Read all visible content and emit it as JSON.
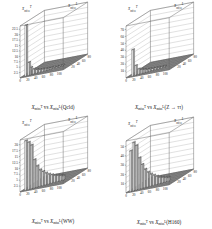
{
  "figure": {
    "type": "multi-panel-3d-lego",
    "panels": 4,
    "layout": "2x2"
  },
  "chart_data": [
    {
      "type": "bar",
      "panel": 1,
      "position": "top-left",
      "title": "",
      "caption": "Xᵀmiss vs Xᴸmiss (QCD)",
      "caption_parts": {
        "var_y": "X",
        "sub_y": "miss",
        "sup_y": "T",
        "vs": "vs",
        "var_x": "X",
        "sub_x": "miss",
        "sup_x": "L",
        "sample": "(Qcld)"
      },
      "sample_label": "QCD",
      "xlabel": "Xᴸmiss",
      "ylabel": "Xᵀmiss",
      "zlabel": "",
      "xticks": [
        0,
        20,
        40,
        60,
        80,
        100
      ],
      "yticks": [
        20,
        40,
        60,
        80
      ],
      "zticks": [
        2.5,
        5,
        7.5,
        10,
        12.5,
        15,
        17.5,
        20,
        22.5
      ],
      "zlim": [
        0,
        24
      ],
      "xlim": [
        0,
        110
      ],
      "ylim": [
        0,
        90
      ],
      "grid": true,
      "legend": "none",
      "peak_value": 23.5,
      "peak_x": 8,
      "peak_y": 6,
      "bars": [
        {
          "x": 8,
          "y": 6,
          "z": 23.5
        },
        {
          "x": 14,
          "y": 8,
          "z": 6.0
        },
        {
          "x": 18,
          "y": 10,
          "z": 3.4
        },
        {
          "x": 24,
          "y": 12,
          "z": 2.3
        },
        {
          "x": 30,
          "y": 14,
          "z": 1.7
        },
        {
          "x": 36,
          "y": 16,
          "z": 1.3
        },
        {
          "x": 42,
          "y": 18,
          "z": 1.1
        },
        {
          "x": 48,
          "y": 20,
          "z": 0.9
        },
        {
          "x": 54,
          "y": 22,
          "z": 0.8
        },
        {
          "x": 60,
          "y": 24,
          "z": 0.7
        },
        {
          "x": 66,
          "y": 26,
          "z": 0.6
        },
        {
          "x": 72,
          "y": 28,
          "z": 0.5
        },
        {
          "x": 78,
          "y": 30,
          "z": 0.45
        },
        {
          "x": 84,
          "y": 32,
          "z": 0.4
        }
      ]
    },
    {
      "type": "bar",
      "panel": 2,
      "position": "top-right",
      "title": "",
      "caption": "Xᵀmiss vs Xᴸmiss (Z → ττ)",
      "caption_parts": {
        "var_y": "X",
        "sub_y": "miss",
        "sup_y": "T",
        "vs": "vs",
        "var_x": "X",
        "sub_x": "miss",
        "sup_x": "L",
        "sample": "(Z → ττ)"
      },
      "sample_label": "Z → ττ",
      "xlabel": "Xᴸmiss",
      "ylabel": "Xᵀmiss",
      "zlabel": "",
      "xticks": [
        0,
        20,
        40,
        60,
        80,
        100
      ],
      "yticks": [
        20,
        40,
        60,
        80
      ],
      "zticks": [
        10,
        20,
        30,
        40,
        50,
        60,
        70
      ],
      "zlim": [
        0,
        75
      ],
      "xlim": [
        0,
        110
      ],
      "ylim": [
        0,
        90
      ],
      "grid": true,
      "legend": "none",
      "peak_value": 38,
      "peak_x": 10,
      "peak_y": 6,
      "bars": [
        {
          "x": 10,
          "y": 6,
          "z": 38.0
        },
        {
          "x": 16,
          "y": 8,
          "z": 14.0
        },
        {
          "x": 22,
          "y": 10,
          "z": 8.0
        },
        {
          "x": 28,
          "y": 12,
          "z": 6.0
        },
        {
          "x": 34,
          "y": 14,
          "z": 5.0
        },
        {
          "x": 40,
          "y": 16,
          "z": 4.0
        },
        {
          "x": 46,
          "y": 18,
          "z": 3.4
        },
        {
          "x": 52,
          "y": 20,
          "z": 3.0
        },
        {
          "x": 58,
          "y": 22,
          "z": 2.6
        },
        {
          "x": 64,
          "y": 24,
          "z": 2.2
        },
        {
          "x": 70,
          "y": 26,
          "z": 1.9
        },
        {
          "x": 76,
          "y": 28,
          "z": 1.6
        }
      ]
    },
    {
      "type": "bar",
      "panel": 3,
      "position": "bottom-left",
      "title": "",
      "caption": "Xᵀmiss vs Xᴸmiss (WW)",
      "caption_parts": {
        "var_y": "X",
        "sub_y": "miss",
        "sup_y": "T",
        "vs": "vs",
        "var_x": "X",
        "sub_x": "miss",
        "sup_x": "L",
        "sample": "(WW)"
      },
      "sample_label": "WW",
      "xlabel": "Xᴸmiss",
      "ylabel": "Xᵀmiss",
      "zlabel": "",
      "xticks": [
        0,
        20,
        40,
        60,
        80,
        100
      ],
      "yticks": [
        20,
        40,
        60,
        80
      ],
      "zticks": [
        2.5,
        5,
        7.5,
        10,
        12.5,
        15,
        17.5,
        20
      ],
      "zlim": [
        0,
        22
      ],
      "xlim": [
        0,
        110
      ],
      "ylim": [
        0,
        90
      ],
      "grid": true,
      "legend": "none",
      "peak_value": 21,
      "peak_x": 10,
      "peak_y": 6,
      "bars": [
        {
          "x": 8,
          "y": 5,
          "z": 21.0
        },
        {
          "x": 14,
          "y": 7,
          "z": 20.0
        },
        {
          "x": 20,
          "y": 9,
          "z": 18.5
        },
        {
          "x": 26,
          "y": 11,
          "z": 12.0
        },
        {
          "x": 32,
          "y": 13,
          "z": 9.0
        },
        {
          "x": 38,
          "y": 15,
          "z": 7.0
        },
        {
          "x": 44,
          "y": 17,
          "z": 6.0
        },
        {
          "x": 50,
          "y": 19,
          "z": 5.0
        },
        {
          "x": 56,
          "y": 21,
          "z": 4.2
        },
        {
          "x": 62,
          "y": 23,
          "z": 3.6
        },
        {
          "x": 68,
          "y": 25,
          "z": 3.0
        },
        {
          "x": 74,
          "y": 27,
          "z": 2.6
        },
        {
          "x": 80,
          "y": 29,
          "z": 2.2
        },
        {
          "x": 86,
          "y": 31,
          "z": 1.8
        }
      ]
    },
    {
      "type": "bar",
      "panel": 4,
      "position": "bottom-right",
      "title": "",
      "caption": "Xᵀmiss vs Xᴸmiss (H160)",
      "caption_parts": {
        "var_y": "X",
        "sub_y": "miss",
        "sup_y": "T",
        "vs": "vs",
        "var_x": "X",
        "sub_x": "miss",
        "sup_x": "L",
        "sample": "(H160)"
      },
      "sample_label": "H160",
      "xlabel": "Xᴸmiss",
      "ylabel": "Xᵀmiss",
      "zlabel": "",
      "xticks": [
        0,
        20,
        40,
        60,
        80,
        100
      ],
      "yticks": [
        20,
        40,
        60,
        80
      ],
      "zticks": [
        10,
        20,
        30,
        40,
        50
      ],
      "zlim": [
        0,
        56
      ],
      "xlim": [
        0,
        110
      ],
      "ylim": [
        0,
        90
      ],
      "grid": true,
      "legend": "none",
      "peak_value": 52,
      "peak_x": 12,
      "peak_y": 7,
      "bars": [
        {
          "x": 6,
          "y": 4,
          "z": 44.0
        },
        {
          "x": 12,
          "y": 6,
          "z": 52.0
        },
        {
          "x": 18,
          "y": 8,
          "z": 48.0
        },
        {
          "x": 24,
          "y": 10,
          "z": 34.0
        },
        {
          "x": 30,
          "y": 12,
          "z": 26.0
        },
        {
          "x": 36,
          "y": 14,
          "z": 20.0
        },
        {
          "x": 42,
          "y": 16,
          "z": 16.0
        },
        {
          "x": 48,
          "y": 18,
          "z": 13.0
        },
        {
          "x": 54,
          "y": 20,
          "z": 11.0
        },
        {
          "x": 60,
          "y": 22,
          "z": 9.0
        },
        {
          "x": 66,
          "y": 24,
          "z": 7.0
        },
        {
          "x": 72,
          "y": 26,
          "z": 6.0
        },
        {
          "x": 78,
          "y": 28,
          "z": 5.0
        },
        {
          "x": 84,
          "y": 30,
          "z": 4.0
        }
      ]
    }
  ]
}
